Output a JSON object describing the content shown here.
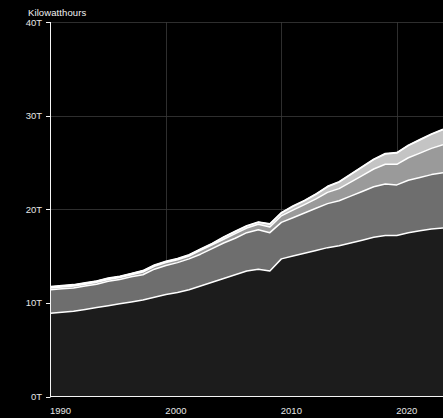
{
  "chart_data": {
    "type": "area",
    "title": "",
    "subtitle": "",
    "xlabel": "",
    "ylabel": "Kilowatthours",
    "stacked": true,
    "grid": true,
    "legend_position": "none",
    "background_color": "#000000",
    "xlim": [
      1990,
      2024
    ],
    "ylim": [
      0,
      40
    ],
    "y_unit": "T",
    "x": [
      1990,
      1991,
      1992,
      1993,
      1994,
      1995,
      1996,
      1997,
      1998,
      1999,
      2000,
      2001,
      2002,
      2003,
      2004,
      2005,
      2006,
      2007,
      2008,
      2009,
      2010,
      2011,
      2012,
      2013,
      2014,
      2015,
      2016,
      2017,
      2018,
      2019,
      2020,
      2021,
      2022,
      2023,
      2024
    ],
    "xticks": [
      1990,
      2000,
      2010,
      2020
    ],
    "xticklabels": [
      "1990",
      "2000",
      "2010",
      "2020"
    ],
    "yticks": [
      0,
      10,
      20,
      30,
      40
    ],
    "yticklabels": [
      "0T",
      "10T",
      "20T",
      "30T",
      "40T"
    ],
    "series": [
      {
        "name": "band-1",
        "color": "#1c1c1c",
        "values": [
          8.9,
          9.0,
          9.1,
          9.3,
          9.5,
          9.7,
          9.9,
          10.1,
          10.3,
          10.6,
          10.9,
          11.1,
          11.4,
          11.8,
          12.2,
          12.6,
          13.0,
          13.4,
          13.6,
          13.4,
          14.7,
          15.0,
          15.3,
          15.6,
          15.9,
          16.1,
          16.4,
          16.7,
          17.0,
          17.2,
          17.2,
          17.5,
          17.7,
          17.9,
          18.0
        ]
      },
      {
        "name": "band-2",
        "color": "#6e6e6e",
        "values": [
          2.5,
          2.5,
          2.5,
          2.5,
          2.5,
          2.6,
          2.6,
          2.7,
          2.7,
          3.0,
          3.1,
          3.2,
          3.3,
          3.4,
          3.6,
          3.8,
          3.9,
          4.1,
          4.2,
          4.1,
          3.9,
          4.1,
          4.3,
          4.5,
          4.7,
          4.8,
          5.0,
          5.2,
          5.4,
          5.5,
          5.4,
          5.6,
          5.7,
          5.8,
          5.9
        ]
      },
      {
        "name": "band-3",
        "color": "#9a9a9a",
        "values": [
          0.2,
          0.2,
          0.2,
          0.2,
          0.2,
          0.2,
          0.2,
          0.2,
          0.3,
          0.3,
          0.3,
          0.3,
          0.3,
          0.4,
          0.4,
          0.4,
          0.5,
          0.5,
          0.6,
          0.6,
          0.7,
          0.8,
          0.9,
          1.0,
          1.2,
          1.3,
          1.5,
          1.7,
          1.9,
          2.1,
          2.2,
          2.4,
          2.6,
          2.8,
          3.0
        ]
      },
      {
        "name": "band-4",
        "color": "#c4c4c4",
        "values": [
          0.1,
          0.1,
          0.1,
          0.1,
          0.1,
          0.1,
          0.1,
          0.1,
          0.1,
          0.1,
          0.1,
          0.1,
          0.1,
          0.1,
          0.1,
          0.2,
          0.2,
          0.2,
          0.2,
          0.3,
          0.3,
          0.4,
          0.4,
          0.5,
          0.6,
          0.7,
          0.8,
          0.9,
          1.0,
          1.1,
          1.2,
          1.3,
          1.4,
          1.5,
          1.6
        ]
      },
      {
        "name": "band-5",
        "color": "#efefef",
        "values": [
          0.05,
          0.05,
          0.05,
          0.05,
          0.05,
          0.05,
          0.05,
          0.05,
          0.05,
          0.05,
          0.05,
          0.05,
          0.05,
          0.05,
          0.05,
          0.05,
          0.05,
          0.05,
          0.05,
          0.05,
          0.05,
          0.05,
          0.05,
          0.05,
          0.05,
          0.05,
          0.05,
          0.05,
          0.05,
          0.05,
          0.05,
          0.05,
          0.05,
          0.05,
          0.05
        ]
      }
    ]
  },
  "axes": {
    "y_axis_title": "Kilowatthours"
  }
}
